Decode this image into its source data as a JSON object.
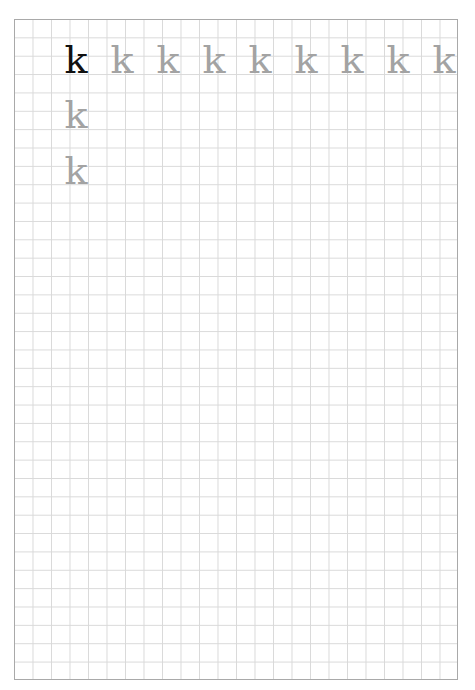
{
  "worksheet": {
    "type": "handwriting-practice-grid",
    "grid": {
      "columns": 24,
      "rows": 36,
      "line_color": "#d9d9d9",
      "border_color": "#a9a9a9"
    },
    "letter": "k",
    "model_color": "#111111",
    "trace_color": "#a3a3a3",
    "rows": [
      {
        "cells": [
          {
            "char": "k",
            "style": "model"
          },
          {
            "char": "k",
            "style": "trace"
          },
          {
            "char": "k",
            "style": "trace"
          },
          {
            "char": "k",
            "style": "trace"
          },
          {
            "char": "k",
            "style": "trace"
          },
          {
            "char": "k",
            "style": "trace"
          },
          {
            "char": "k",
            "style": "trace"
          },
          {
            "char": "k",
            "style": "trace"
          },
          {
            "char": "k",
            "style": "trace"
          }
        ]
      },
      {
        "cells": [
          {
            "char": "k",
            "style": "trace"
          }
        ]
      },
      {
        "cells": [
          {
            "char": "k",
            "style": "trace"
          }
        ]
      }
    ]
  }
}
